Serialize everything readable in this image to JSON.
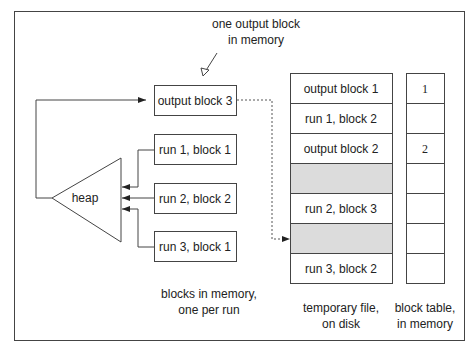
{
  "annotation": {
    "line1": "one output block",
    "line2": "in memory"
  },
  "heap": {
    "label": "heap"
  },
  "memory_blocks": [
    {
      "label": "output block 3"
    },
    {
      "label": "run 1, block 1"
    },
    {
      "label": "run 2, block 2"
    },
    {
      "label": "run 3, block 1"
    }
  ],
  "memory_caption": {
    "line1": "blocks in memory,",
    "line2": "one per run"
  },
  "temp_file": {
    "rows": [
      {
        "label": "output block 1",
        "shaded": false
      },
      {
        "label": "run 1, block 2",
        "shaded": false
      },
      {
        "label": "output block  2",
        "shaded": false
      },
      {
        "label": "",
        "shaded": true
      },
      {
        "label": "run  2, block 3",
        "shaded": false
      },
      {
        "label": "",
        "shaded": true
      },
      {
        "label": "run 3, block  2",
        "shaded": false
      }
    ],
    "caption_line1": "temporary file,",
    "caption_line2": "on disk"
  },
  "block_table": {
    "rows": [
      "1",
      "",
      "2",
      "",
      "",
      "",
      ""
    ],
    "caption_line1": "block table,",
    "caption_line2": "in memory"
  },
  "colors": {
    "stroke": "#444444",
    "shaded_fill": "#dcdcdc",
    "background": "#ffffff"
  }
}
